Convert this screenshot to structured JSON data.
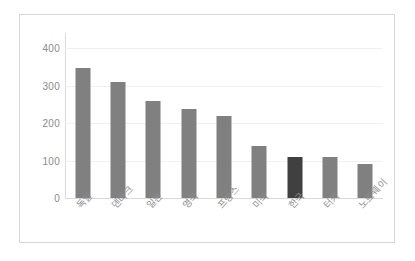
{
  "chart_data": {
    "type": "bar",
    "title": "",
    "subtitle": "",
    "xlabel": "",
    "ylabel": "",
    "categories": [
      "독일",
      "덴마크",
      "일본",
      "영국",
      "프랑스",
      "미국",
      "한국",
      "터키",
      "노르웨이"
    ],
    "values": [
      348,
      310,
      258,
      238,
      219,
      138,
      110,
      109,
      92
    ],
    "ylim": [
      0,
      440
    ],
    "ytick_labels": [
      "400",
      "300",
      "200",
      "100",
      "0"
    ],
    "ytick_values": [
      400,
      300,
      200,
      100,
      0
    ],
    "grid": true,
    "legend": "none",
    "highlight_index": 6,
    "colors": {
      "bar": "#808080",
      "bar_highlight": "#404040",
      "gridline": "#f0f0f0",
      "axis": "#d9d9d9",
      "tick_text": "#8a8a8a",
      "category_text": "#8d8d8d",
      "frame_border": "#d6d6d6",
      "background": "#ffffff"
    }
  }
}
